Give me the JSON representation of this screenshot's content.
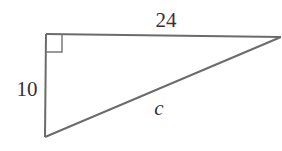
{
  "diagram": {
    "type": "right-triangle",
    "stroke_color": "#6b6b6b",
    "label_color": "#333333",
    "vertices": {
      "top_left": [
        46,
        34
      ],
      "top_right": [
        281,
        37
      ],
      "bottom_left": [
        45,
        137
      ]
    },
    "labels": {
      "top_side": "24",
      "left_side": "10",
      "hypotenuse": "c"
    },
    "right_angle_marker": true
  }
}
